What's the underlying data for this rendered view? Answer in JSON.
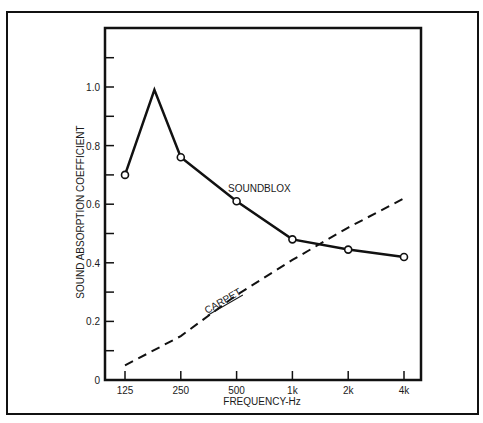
{
  "chart_data": {
    "type": "line",
    "title": "",
    "xlabel": "FREQUENCY-Hz",
    "ylabel": "SOUND ABSORPTION COEFFICIENT",
    "x_scale": "log2",
    "categories": [
      "125",
      "250",
      "500",
      "1k",
      "2k",
      "4k"
    ],
    "y_ticks": [
      "0",
      "0.2",
      "0.4",
      "0.6",
      "0.8",
      "1.0"
    ],
    "y_minor_ticks": [
      0.1,
      0.3,
      0.5,
      0.7,
      0.9,
      1.1
    ],
    "ylim": [
      0,
      1.2
    ],
    "grid": false,
    "legend": "inline labels",
    "series": [
      {
        "name": "SOUNDBLOX",
        "style": "solid, open circle markers",
        "points": [
          {
            "x": "125",
            "y": 0.7,
            "marker": true
          },
          {
            "x": "~180",
            "y": 0.99,
            "marker": false
          },
          {
            "x": "250",
            "y": 0.76,
            "marker": true
          },
          {
            "x": "500",
            "y": 0.61,
            "marker": true
          },
          {
            "x": "1k",
            "y": 0.48,
            "marker": true
          },
          {
            "x": "2k",
            "y": 0.445,
            "marker": true
          },
          {
            "x": "4k",
            "y": 0.42,
            "marker": true
          }
        ]
      },
      {
        "name": "CARPET",
        "style": "dashed",
        "points": [
          {
            "x": "125",
            "y": 0.05
          },
          {
            "x": "250",
            "y": 0.15
          },
          {
            "x": "500",
            "y": 0.29
          },
          {
            "x": "1k",
            "y": 0.41
          },
          {
            "x": "2k",
            "y": 0.52
          },
          {
            "x": "4k",
            "y": 0.62
          }
        ]
      }
    ]
  },
  "colors": {
    "ink": "#111111",
    "background": "#ffffff"
  }
}
